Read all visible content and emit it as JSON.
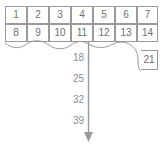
{
  "diagram": {
    "kind": "number-grid-sequence",
    "colors": {
      "grid_line": "#9a9a9a",
      "cell_text": "#6f6f6f",
      "sequence_text": "#8c8c8c",
      "arrow": "#9a9a9a",
      "background": "#ffffff"
    },
    "grid": {
      "columns": 7,
      "rows": [
        {
          "cells": [
            {
              "label": "1",
              "x": 5,
              "y": 6,
              "w": 22,
              "h": 18
            },
            {
              "label": "2",
              "x": 27,
              "y": 6,
              "w": 22,
              "h": 18
            },
            {
              "label": "3",
              "x": 49,
              "y": 6,
              "w": 22,
              "h": 18
            },
            {
              "label": "4",
              "x": 71,
              "y": 6,
              "w": 22,
              "h": 18
            },
            {
              "label": "5",
              "x": 93,
              "y": 6,
              "w": 22,
              "h": 18
            },
            {
              "label": "6",
              "x": 115,
              "y": 6,
              "w": 22,
              "h": 18
            },
            {
              "label": "7",
              "x": 137,
              "y": 6,
              "w": 21,
              "h": 18
            }
          ]
        },
        {
          "cells": [
            {
              "label": "8",
              "x": 5,
              "y": 24,
              "w": 22,
              "h": 18
            },
            {
              "label": "9",
              "x": 27,
              "y": 24,
              "w": 22,
              "h": 18
            },
            {
              "label": "10",
              "x": 49,
              "y": 24,
              "w": 22,
              "h": 18
            },
            {
              "label": "11",
              "x": 71,
              "y": 24,
              "w": 22,
              "h": 18
            },
            {
              "label": "12",
              "x": 93,
              "y": 24,
              "w": 22,
              "h": 18
            },
            {
              "label": "13",
              "x": 115,
              "y": 24,
              "w": 22,
              "h": 18
            },
            {
              "label": "14",
              "x": 137,
              "y": 24,
              "w": 21,
              "h": 18
            }
          ]
        }
      ],
      "detached_cell": {
        "label": "21",
        "x": 141,
        "y": 50,
        "w": 17,
        "h": 20
      }
    },
    "sequence": {
      "step": 7,
      "labels": [
        {
          "value": "18",
          "x": 62,
          "y": 53
        },
        {
          "value": "25",
          "x": 62,
          "y": 74
        },
        {
          "value": "32",
          "x": 62,
          "y": 95
        },
        {
          "value": "39",
          "x": 62,
          "y": 116
        }
      ]
    },
    "arrow": {
      "x": 88.5,
      "y_start": 42,
      "y_end": 140,
      "head_width": 9,
      "head_height": 9
    }
  }
}
